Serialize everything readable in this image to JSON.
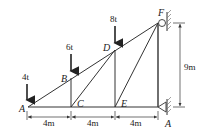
{
  "diagram": {
    "type": "truss",
    "nodes": [
      {
        "id": "A",
        "label": "A",
        "x": 28,
        "y": 107
      },
      {
        "id": "B",
        "label": "B",
        "x": 71,
        "y": 78
      },
      {
        "id": "C",
        "label": "C",
        "x": 71,
        "y": 107
      },
      {
        "id": "D",
        "label": "D",
        "x": 115,
        "y": 50
      },
      {
        "id": "E",
        "label": "E",
        "x": 115,
        "y": 107
      },
      {
        "id": "F",
        "label": "F",
        "x": 158,
        "y": 23
      },
      {
        "id": "G",
        "label": "A",
        "x": 158,
        "y": 107
      }
    ],
    "members": [
      [
        "A",
        "B"
      ],
      [
        "B",
        "D"
      ],
      [
        "D",
        "F"
      ],
      [
        "A",
        "C"
      ],
      [
        "C",
        "E"
      ],
      [
        "E",
        "G"
      ],
      [
        "B",
        "C"
      ],
      [
        "C",
        "D"
      ],
      [
        "D",
        "E"
      ],
      [
        "E",
        "F"
      ],
      [
        "F",
        "G"
      ]
    ],
    "loads": [
      {
        "node": "A",
        "label": "4t"
      },
      {
        "node": "B",
        "label": "6t"
      },
      {
        "node": "D",
        "label": "8t"
      }
    ],
    "supports": [
      {
        "node": "F",
        "type": "pin-wall",
        "label": "F"
      },
      {
        "node": "G",
        "type": "roller-wall",
        "label": "A"
      }
    ],
    "dimensions": {
      "horizontal": [
        "4m",
        "4m",
        "4m"
      ],
      "vertical": "9m"
    },
    "colors": {
      "line": "#333333",
      "text": "#222222",
      "background": "#ffffff"
    }
  }
}
